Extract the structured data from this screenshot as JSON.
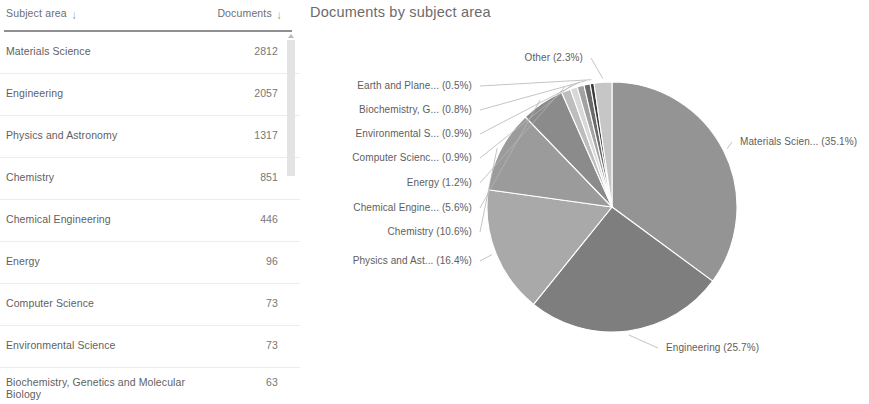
{
  "table": {
    "columns": [
      {
        "key": "subject",
        "label": "Subject area",
        "sort_icon": "sort-descending-arrow",
        "sort_glyph": "↓"
      },
      {
        "key": "documents",
        "label": "Documents",
        "sort_icon": "sort-descending-arrow",
        "sort_glyph": "↓"
      }
    ],
    "rows": [
      {
        "subject": "Materials Science",
        "documents": "2812"
      },
      {
        "subject": "Engineering",
        "documents": "2057"
      },
      {
        "subject": "Physics and Astronomy",
        "documents": "1317"
      },
      {
        "subject": "Chemistry",
        "documents": "851"
      },
      {
        "subject": "Chemical Engineering",
        "documents": "446"
      },
      {
        "subject": "Energy",
        "documents": "96"
      },
      {
        "subject": "Computer Science",
        "documents": "73"
      },
      {
        "subject": "Environmental Science",
        "documents": "73"
      },
      {
        "subject": "Biochemistry, Genetics and Molecular Biology",
        "documents": "63"
      }
    ],
    "scrollbar": {
      "icon": "scroll-up-arrow"
    }
  },
  "chart": {
    "title": "Documents by subject area"
  },
  "chart_data": {
    "type": "pie",
    "title": "Documents by subject area",
    "legend_position": "callout-labels",
    "labels": [
      "Materials Scien... (35.1%)",
      "Engineering (25.7%)",
      "Physics and Ast... (16.4%)",
      "Chemistry (10.6%)",
      "Chemical Engine... (5.6%)",
      "Energy (1.2%)",
      "Computer Scienc... (0.9%)",
      "Environmental S... (0.9%)",
      "Biochemistry, G... (0.8%)",
      "Earth and Plane... (0.5%)",
      "Other (2.3%)"
    ],
    "categories": [
      "Materials Science",
      "Engineering",
      "Physics and Astronomy",
      "Chemistry",
      "Chemical Engineering",
      "Energy",
      "Computer Science",
      "Environmental Science",
      "Biochemistry, Genetics and Molecular Biology",
      "Earth and Planetary Sciences",
      "Other"
    ],
    "values": [
      35.1,
      25.7,
      16.4,
      10.6,
      5.6,
      1.2,
      0.9,
      0.9,
      0.8,
      0.5,
      2.3
    ],
    "unit": "%",
    "colors": [
      "#949494",
      "#7e7e7e",
      "#a9a9a9",
      "#9b9b9b",
      "#8b8b8b",
      "#bdbdbd",
      "#d8d8d8",
      "#a2a2a2",
      "#6a6a6a",
      "#3a3a3a",
      "#c6c6c6"
    ]
  }
}
